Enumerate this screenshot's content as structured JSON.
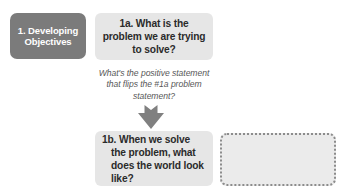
{
  "diagram": {
    "stage": {
      "label": "1. Developing Objectives",
      "fill_color": "#7b7b7b",
      "text_color": "#ffffff"
    },
    "boxes": [
      {
        "id": "1a",
        "text": "1a. What is the problem we are trying to solve?",
        "fill_color": "#e6e6e6",
        "text_color": "#2b2b2b"
      },
      {
        "id": "1b",
        "text": "1b. When we solve the problem, what does the world look like?",
        "fill_color": "#e6e6e6",
        "text_color": "#2b2b2b"
      }
    ],
    "connector": {
      "prompt": "What's the positive statement that flips the #1a problem statement?",
      "prompt_color": "#585858",
      "arrow": {
        "direction": "down",
        "color": "#808080"
      }
    },
    "answer_placeholder": {
      "text": "",
      "fill_color": "#ebebeb",
      "border_color": "#8c8c8c",
      "border_style": "dotted"
    }
  }
}
